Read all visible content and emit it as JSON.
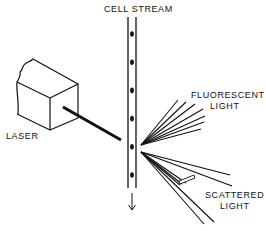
{
  "diagram": {
    "labels": {
      "cell_stream": "CELL  STREAM",
      "laser": "LASER",
      "fluorescent_line1": "FLUORESCENT",
      "fluorescent_line2": "LIGHT",
      "scattered_line1": "SCATTERED",
      "scattered_line2": "LIGHT"
    },
    "cell_count": 6,
    "fluorescent_ray_count": 7,
    "scattered_ray_count": 7,
    "colors": {
      "ink": "#111111",
      "background": "#ffffff"
    }
  }
}
